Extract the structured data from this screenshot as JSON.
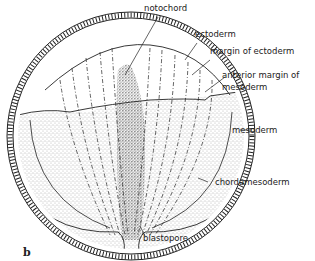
{
  "figure": {
    "panel_letter": "b",
    "labels": {
      "notochord": "notochord",
      "ectoderm": "ectoderm",
      "margin_of_ectoderm": "margin of ectoderm",
      "anterior_margin_line1": "anterior margin of",
      "anterior_margin_line2": "mesoderm",
      "mesoderm": "mesoderm",
      "chordamesoderm": "chordamesoderm",
      "blastopore": "blastopore"
    },
    "colors": {
      "ink": "#222222",
      "stipple": "#555555",
      "background": "#ffffff"
    }
  }
}
